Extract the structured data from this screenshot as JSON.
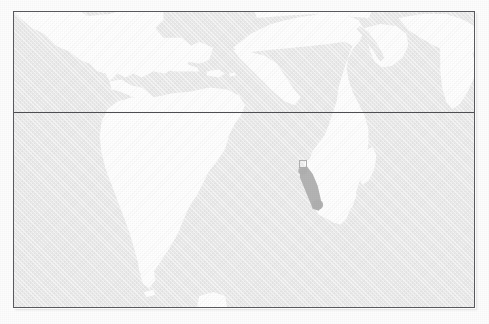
{
  "figure": {
    "type": "world-map",
    "caption": "",
    "projection_note": "Atlantic-centred world map, equirectangular",
    "background_color": "#fdfdfd",
    "ocean_color": "#ebebeb",
    "land_color": "#ffffff",
    "frame_color": "#5a5a5e",
    "line_color": "#4e4e52",
    "marker_color": "#b0b0b0"
  },
  "frame": {
    "label": "map-border",
    "x": 13,
    "y": 11,
    "width": 462,
    "height": 297
  },
  "graticule": {
    "lines": [
      {
        "name": "equator",
        "orientation": "horizontal",
        "y": 100,
        "label": ""
      }
    ]
  },
  "landmasses": [
    {
      "name": "north-america",
      "label": ""
    },
    {
      "name": "central-america",
      "label": ""
    },
    {
      "name": "caribbean-islands",
      "label": ""
    },
    {
      "name": "south-america",
      "label": ""
    },
    {
      "name": "africa",
      "label": ""
    },
    {
      "name": "madagascar",
      "label": ""
    },
    {
      "name": "arabian-peninsula",
      "label": ""
    },
    {
      "name": "southwest-asia",
      "label": ""
    },
    {
      "name": "southern-europe",
      "label": ""
    },
    {
      "name": "antarctic-peninsula-tip",
      "label": ""
    }
  ],
  "marker": {
    "name": "study-area-marker",
    "box": {
      "x": 298,
      "y": 159,
      "width": 8,
      "height": 8
    },
    "track": {
      "description": "elongated shaded band running southeast from the marker box",
      "start": {
        "x": 302,
        "y": 167
      },
      "end": {
        "x": 317,
        "y": 205
      },
      "color": "#b0b0b0"
    }
  },
  "chart_data": {
    "type": "map",
    "title": "",
    "xlabel": "",
    "ylabel": "",
    "annotations": [
      {
        "label": "",
        "kind": "square-outline",
        "lon_approx": 11.5,
        "lat_approx": -9.0
      },
      {
        "label": "",
        "kind": "shaded-track",
        "lon_range": [
          11.5,
          15.0
        ],
        "lat_range": [
          -10.0,
          -24.0
        ]
      }
    ]
  }
}
